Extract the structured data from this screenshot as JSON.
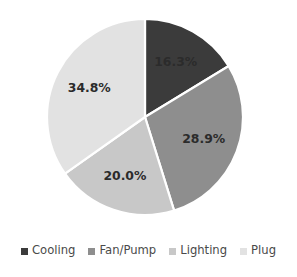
{
  "chart_data": {
    "type": "pie",
    "title": "",
    "categories": [
      "Cooling",
      "Fan/Pump",
      "Lighting",
      "Plug"
    ],
    "values": [
      16.3,
      28.9,
      20.0,
      34.8
    ],
    "data_labels": [
      "16.3%",
      "28.9%",
      "20.0%",
      "34.8%"
    ],
    "unit": "%",
    "start_angle_deg": 0,
    "direction": "clockwise",
    "legend_position": "bottom",
    "grid": false,
    "colors": [
      "#3b3b3b",
      "#8e8e8e",
      "#c8c8c8",
      "#e2e2e2"
    ],
    "slice_border_color": "#ffffff",
    "label_color": "#2b2b2b",
    "background_color": "#ffffff"
  },
  "legend": {
    "items": [
      {
        "label": "Cooling",
        "color": "#3b3b3b"
      },
      {
        "label": "Fan/Pump",
        "color": "#8e8e8e"
      },
      {
        "label": "Lighting",
        "color": "#c8c8c8"
      },
      {
        "label": "Plug",
        "color": "#e2e2e2"
      }
    ]
  },
  "geometry": {
    "center_x": 145,
    "center_y": 117,
    "radius": 98,
    "label_radius_factor": 0.64
  }
}
